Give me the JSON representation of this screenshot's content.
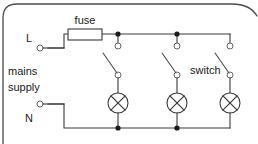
{
  "diagram": {
    "type": "electrical-schematic",
    "frame_color": "#4a4a4a",
    "wire_color": "#3a3a3a",
    "background": "#ffffff"
  },
  "labels": {
    "fuse": "fuse",
    "switch": "switch",
    "mains_line1": "mains",
    "mains_line2": "supply",
    "live_terminal": "L",
    "neutral_terminal": "N"
  },
  "components": {
    "fuse": {
      "name": "fuse",
      "symbol": "rectangle-in-line",
      "x": 68,
      "y": 29,
      "width": 34,
      "height": 11
    },
    "switches": [
      {
        "name": "switch-1",
        "symbol": "open-switch",
        "x": 118,
        "open": true
      },
      {
        "name": "switch-2",
        "symbol": "open-switch",
        "x": 177,
        "open": true
      },
      {
        "name": "switch-3",
        "symbol": "open-switch",
        "x": 230,
        "open": true
      }
    ],
    "lamps": [
      {
        "name": "lamp-1",
        "symbol": "crossed-circle",
        "x": 118,
        "y": 103,
        "radius": 10
      },
      {
        "name": "lamp-2",
        "symbol": "crossed-circle",
        "x": 177,
        "y": 103,
        "radius": 10
      },
      {
        "name": "lamp-3",
        "symbol": "crossed-circle",
        "x": 230,
        "y": 103,
        "radius": 10
      }
    ],
    "junctions": [
      {
        "name": "junction-live-1",
        "x": 118,
        "y": 34
      },
      {
        "name": "junction-live-2",
        "x": 177,
        "y": 34
      },
      {
        "name": "junction-neutral-1",
        "x": 118,
        "y": 128
      },
      {
        "name": "junction-neutral-2",
        "x": 177,
        "y": 128
      }
    ],
    "terminals": [
      {
        "name": "live-terminal",
        "label": "L",
        "x": 37,
        "y": 48
      },
      {
        "name": "neutral-terminal",
        "label": "N",
        "x": 37,
        "y": 104
      }
    ]
  },
  "buses": {
    "live_y": 34,
    "neutral_y": 128,
    "live_start_x": 37,
    "live_end_x": 230,
    "neutral_start_x": 37,
    "neutral_end_x": 230
  }
}
